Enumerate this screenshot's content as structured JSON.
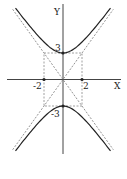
{
  "chart_data": {
    "type": "line",
    "title": "",
    "equation": "y^2/9 - x^2/4 = 1",
    "a": 3,
    "b": 2,
    "xlabel": "X",
    "ylabel": "Y",
    "tick_labels": {
      "x": [
        "-2",
        "2"
      ],
      "y": [
        "3",
        "-3"
      ]
    },
    "vertices": [
      [
        0,
        3
      ],
      [
        0,
        -3
      ]
    ],
    "marked_points": [
      [
        -2,
        0
      ],
      [
        2,
        0
      ],
      [
        0,
        3
      ],
      [
        0,
        -3
      ]
    ],
    "asymptotes": [
      "y = 1.5x",
      "y = -1.5x"
    ],
    "rectangle": {
      "x": [
        -2,
        2
      ],
      "y": [
        -3,
        3
      ]
    },
    "xlim": [
      -6.0,
      6.3
    ],
    "ylim": [
      -8.4,
      8.5
    ],
    "grid": false,
    "legend": null
  },
  "axes": {
    "x_label": "X",
    "y_label": "Y"
  },
  "labels": {
    "x_neg": "-2",
    "x_pos": "2",
    "y_pos": "3",
    "y_neg": "-3"
  },
  "colors": {
    "curve": "#222222",
    "axis": "#444444",
    "dashed": "#888888"
  }
}
